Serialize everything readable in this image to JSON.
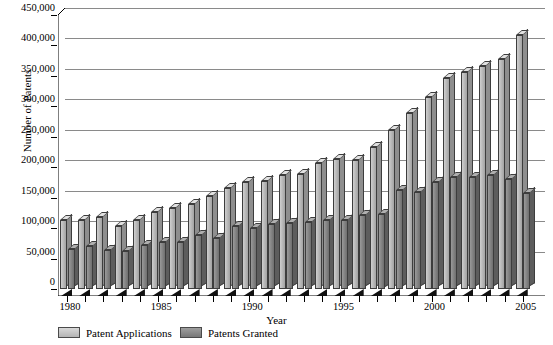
{
  "chart_data": {
    "type": "bar",
    "title": "",
    "xlabel": "Year",
    "ylabel": "Number of Patents",
    "ylim": [
      0,
      450000
    ],
    "ytick_values": [
      0,
      50000,
      100000,
      150000,
      200000,
      250000,
      300000,
      350000,
      400000,
      450000
    ],
    "ytick_labels": [
      "0",
      "50,000",
      "100,000",
      "150,000",
      "200,000",
      "250,000",
      "300,000",
      "350,000",
      "400,000",
      "450,000"
    ],
    "grid": true,
    "legend_position": "bottom-left",
    "categories": [
      1980,
      1981,
      1982,
      1983,
      1984,
      1985,
      1986,
      1987,
      1988,
      1989,
      1990,
      1991,
      1992,
      1993,
      1994,
      1995,
      1996,
      1997,
      1998,
      1999,
      2000,
      2001,
      2002,
      2003,
      2004,
      2005
    ],
    "xtick_labels": [
      "1980",
      "1985",
      "1990",
      "1995",
      "2000",
      "2005"
    ],
    "xtick_label_years": [
      1980,
      1985,
      1990,
      1995,
      2000,
      2005
    ],
    "series": [
      {
        "name": "Patent Applications",
        "color": "#b6b6b6",
        "values": [
          113000,
          114000,
          118000,
          104000,
          113000,
          127000,
          133000,
          140000,
          152000,
          166000,
          176000,
          178000,
          187000,
          189000,
          207000,
          213000,
          212000,
          233000,
          261000,
          289000,
          316000,
          346000,
          357000,
          367000,
          377000,
          418000
        ]
      },
      {
        "name": "Patents Granted",
        "color": "#828282",
        "values": [
          66000,
          71000,
          64000,
          62000,
          72000,
          77000,
          77000,
          89000,
          84000,
          103000,
          100000,
          107000,
          108000,
          110000,
          113000,
          114000,
          122000,
          124000,
          163000,
          159000,
          176000,
          184000,
          184000,
          188000,
          181000,
          158000
        ]
      }
    ]
  }
}
